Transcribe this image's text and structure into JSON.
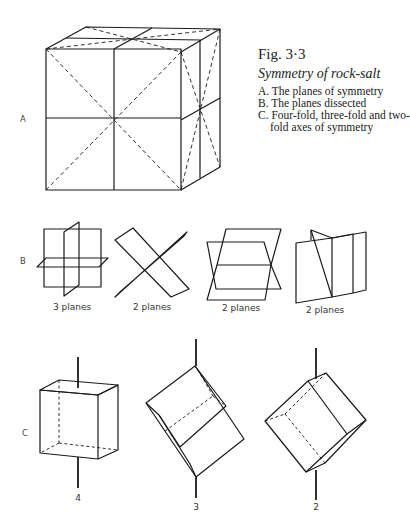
{
  "caption": {
    "figure_number": "Fig. 3·3",
    "title": "Symmetry of rock-salt",
    "items": [
      "A. The planes of symmetry",
      "B. The planes dissected",
      "C. Four-fold, three-fold and two-fold axes of symmetry"
    ]
  },
  "section_labels": {
    "a": "A",
    "b": "B",
    "c": "C"
  },
  "section_b": {
    "subfigures": [
      {
        "label": "3 planes"
      },
      {
        "label": "2 planes"
      },
      {
        "label": "2 planes"
      },
      {
        "label": "2 planes"
      }
    ]
  },
  "section_c": {
    "axes": [
      {
        "label": "4"
      },
      {
        "label": "3"
      },
      {
        "label": "2"
      }
    ]
  },
  "colors": {
    "ink": "#1a1a1a",
    "paper": "#ffffff"
  }
}
